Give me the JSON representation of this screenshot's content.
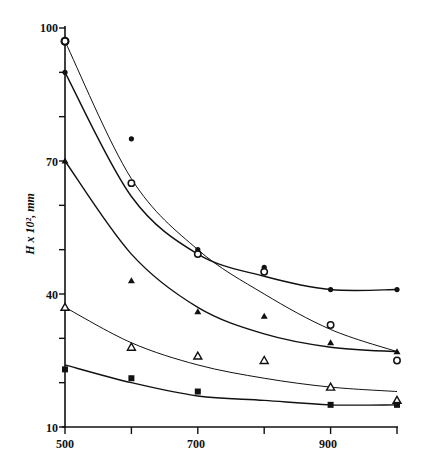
{
  "chart_data": {
    "type": "scatter",
    "title": "",
    "xlabel": "",
    "ylabel": "H x 10², mm",
    "xlim": [
      500,
      1000
    ],
    "ylim": [
      10,
      100
    ],
    "x_ticks": [
      500,
      600,
      700,
      800,
      900,
      1000
    ],
    "x_tick_labels": [
      "500",
      "",
      "700",
      "",
      "900",
      ""
    ],
    "y_ticks": [
      10,
      20,
      30,
      40,
      50,
      60,
      70,
      80,
      90,
      100
    ],
    "y_tick_labels": [
      "10",
      "",
      "",
      "40",
      "",
      "",
      "70",
      "",
      "",
      "100"
    ],
    "grid": false,
    "legend": null,
    "x": [
      500,
      600,
      700,
      800,
      900,
      1000
    ],
    "series": [
      {
        "name": "filled circles",
        "marker": "filled-circle",
        "points": [
          [
            500,
            97
          ],
          [
            500,
            90
          ],
          [
            600,
            75
          ],
          [
            700,
            50
          ],
          [
            800,
            46
          ],
          [
            900,
            41
          ],
          [
            1000,
            41
          ]
        ],
        "fit_curve": [
          90,
          62,
          49,
          44,
          41,
          41
        ]
      },
      {
        "name": "open circles",
        "marker": "open-circle",
        "points": [
          [
            500,
            97
          ],
          [
            600,
            65
          ],
          [
            700,
            49
          ],
          [
            800,
            45
          ],
          [
            900,
            33
          ],
          [
            1000,
            25
          ]
        ],
        "fit_curve": [
          97,
          66,
          50,
          40,
          32,
          27
        ]
      },
      {
        "name": "filled triangles",
        "marker": "filled-triangle",
        "points": [
          [
            500,
            70
          ],
          [
            600,
            43
          ],
          [
            700,
            36
          ],
          [
            800,
            35
          ],
          [
            900,
            29
          ],
          [
            1000,
            27
          ]
        ],
        "fit_curve": [
          70,
          49,
          37,
          31,
          28,
          27
        ]
      },
      {
        "name": "open triangles",
        "marker": "open-triangle",
        "points": [
          [
            500,
            37
          ],
          [
            600,
            28
          ],
          [
            700,
            26
          ],
          [
            800,
            25
          ],
          [
            900,
            19
          ],
          [
            1000,
            16
          ]
        ],
        "fit_curve": [
          37,
          29,
          24,
          21,
          19,
          18
        ]
      },
      {
        "name": "filled squares",
        "marker": "filled-square",
        "points": [
          [
            500,
            23
          ],
          [
            600,
            21
          ],
          [
            700,
            18
          ],
          [
            900,
            15
          ],
          [
            1000,
            15
          ]
        ],
        "fit_curve": [
          24,
          20,
          17,
          16,
          15,
          15
        ]
      }
    ]
  },
  "labels": {
    "y_axis_title": "H x 10², mm",
    "y_tick_100": "100",
    "y_tick_70": "70",
    "y_tick_40": "40",
    "y_tick_10": "10",
    "x_tick_500": "500",
    "x_tick_700": "700",
    "x_tick_900": "900"
  }
}
